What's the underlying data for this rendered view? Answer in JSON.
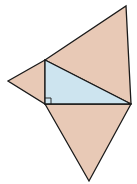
{
  "diagram": {
    "title": "",
    "colors": {
      "outer_fill": "#e8c9b6",
      "inner_fill": "#cde4ef",
      "stroke": "#1a1a1a",
      "background": "#ffffff"
    },
    "points": {
      "A": [
        45,
        60
      ],
      "C": [
        45,
        104
      ],
      "B": [
        131,
        104
      ],
      "top": [
        126,
        6
      ],
      "left": [
        8,
        81
      ],
      "bottom": [
        89,
        181
      ]
    },
    "shapes": [
      {
        "name": "hypotenuse-triangle",
        "vertices": [
          "A",
          "top",
          "B"
        ],
        "fill": "outer"
      },
      {
        "name": "leg-vertical-triangle",
        "vertices": [
          "A",
          "left",
          "C"
        ],
        "fill": "outer"
      },
      {
        "name": "leg-horizontal-triangle",
        "vertices": [
          "C",
          "bottom",
          "B"
        ],
        "fill": "outer"
      },
      {
        "name": "right-triangle",
        "vertices": [
          "A",
          "C",
          "B"
        ],
        "fill": "inner"
      }
    ],
    "right_angle_marker": {
      "at": "C",
      "size": 6
    }
  }
}
